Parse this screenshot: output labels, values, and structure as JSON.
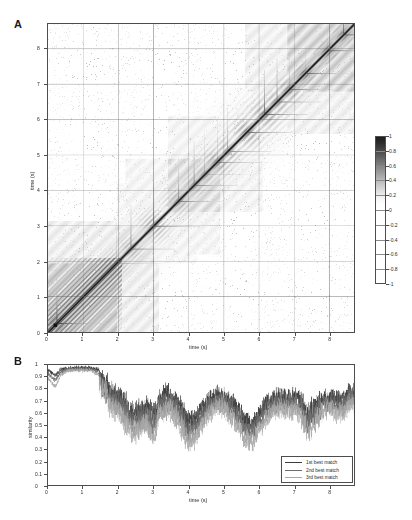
{
  "figure": {
    "panels": [
      {
        "id": "A",
        "label": "A"
      },
      {
        "id": "B",
        "label": "B"
      }
    ]
  },
  "panelA": {
    "label": "A",
    "xlabel": "time (s)",
    "ylabel": "time (s)",
    "xticks": [
      "0",
      "1",
      "2",
      "3",
      "4",
      "5",
      "6",
      "7",
      "8"
    ],
    "yticks": [
      "0",
      "1",
      "2",
      "3",
      "4",
      "5",
      "6",
      "7",
      "8"
    ]
  },
  "colorbar": {
    "ticks": [
      "1",
      "0.8",
      "0.6",
      "0.4",
      "0.2",
      "0",
      "-0.2",
      "-0.4",
      "-0.6",
      "-0.8",
      "-1"
    ],
    "max": "1",
    "min": "-1"
  },
  "panelB": {
    "label": "B",
    "xlabel": "time (s)",
    "ylabel": "similarity",
    "xticks": [
      "0",
      "1",
      "2",
      "3",
      "4",
      "5",
      "6",
      "7",
      "8"
    ],
    "yticks": [
      "0",
      "0.1",
      "0.2",
      "0.3",
      "0.4",
      "0.5",
      "0.6",
      "0.7",
      "0.8",
      "0.9",
      "1"
    ],
    "legend": [
      {
        "label": "1st best match",
        "color": "#3c3c3c"
      },
      {
        "label": "2nd best match",
        "color": "#6e6e6e"
      },
      {
        "label": "3rd best match",
        "color": "#a8a8a8"
      }
    ]
  },
  "chart_data": [
    {
      "type": "heatmap",
      "title": "",
      "panel": "A",
      "xlabel": "time (s)",
      "ylabel": "time (s)",
      "xlim": [
        0,
        8.7
      ],
      "ylim": [
        0,
        8.7
      ],
      "xticks": [
        0,
        1,
        2,
        3,
        4,
        5,
        6,
        7,
        8
      ],
      "yticks": [
        0,
        1,
        2,
        3,
        4,
        5,
        6,
        7,
        8
      ],
      "grid": true,
      "colorbar": {
        "label": "",
        "vmin": -1,
        "vmax": 1,
        "ticks": [
          1,
          0.8,
          0.6,
          0.4,
          0.2,
          0,
          -0.2,
          -0.4,
          -0.6,
          -0.8,
          -1
        ],
        "colormap": "grayscale-inverted"
      },
      "description": "Self-similarity / recurrence matrix of an audio signal; high values on main diagonal with repeating chevron (feather) structures whose period grows with time, plus vertical and horizontal ridge spikes at onsets.",
      "diagonal_events": [
        {
          "t": 0.25,
          "intensity": 1.0
        },
        {
          "t": 1.95,
          "intensity": 0.72
        },
        {
          "t": 2.35,
          "intensity": 0.68
        },
        {
          "t": 3.0,
          "intensity": 0.74
        },
        {
          "t": 3.7,
          "intensity": 0.7
        },
        {
          "t": 4.15,
          "intensity": 0.66
        },
        {
          "t": 4.45,
          "intensity": 0.64
        },
        {
          "t": 4.8,
          "intensity": 0.78
        },
        {
          "t": 5.1,
          "intensity": 0.62
        },
        {
          "t": 5.65,
          "intensity": 0.8
        },
        {
          "t": 6.15,
          "intensity": 0.82
        },
        {
          "t": 6.5,
          "intensity": 0.7
        },
        {
          "t": 6.85,
          "intensity": 0.76
        },
        {
          "t": 7.3,
          "intensity": 0.84
        },
        {
          "t": 7.95,
          "intensity": 0.86
        },
        {
          "t": 8.4,
          "intensity": 0.8
        }
      ],
      "block_regions": [
        {
          "x0": 0.0,
          "x1": 1.95,
          "y0": 0.0,
          "y1": 1.95,
          "mean": 0.45
        },
        {
          "x0": 1.95,
          "x1": 3.0,
          "y0": 1.95,
          "y1": 3.0,
          "mean": 0.22
        },
        {
          "x0": 3.4,
          "x1": 4.9,
          "y0": 3.4,
          "y1": 4.9,
          "mean": 0.3
        },
        {
          "x0": 6.8,
          "x1": 8.7,
          "y0": 6.8,
          "y1": 8.7,
          "mean": 0.38
        }
      ]
    },
    {
      "type": "line",
      "panel": "B",
      "title": "",
      "xlabel": "time (s)",
      "ylabel": "similarity",
      "xlim": [
        0,
        8.7
      ],
      "ylim": [
        0,
        1
      ],
      "xticks": [
        0,
        1,
        2,
        3,
        4,
        5,
        6,
        7,
        8
      ],
      "yticks": [
        0,
        0.1,
        0.2,
        0.3,
        0.4,
        0.5,
        0.6,
        0.7,
        0.8,
        0.9,
        1.0
      ],
      "grid": false,
      "legend_position": "lower right",
      "x": [
        0.0,
        0.2,
        0.4,
        0.6,
        0.8,
        1.0,
        1.2,
        1.4,
        1.6,
        1.8,
        2.0,
        2.2,
        2.4,
        2.6,
        2.8,
        3.0,
        3.2,
        3.4,
        3.6,
        3.8,
        4.0,
        4.2,
        4.4,
        4.6,
        4.8,
        5.0,
        5.2,
        5.4,
        5.6,
        5.8,
        6.0,
        6.2,
        6.4,
        6.6,
        6.8,
        7.0,
        7.2,
        7.4,
        7.6,
        7.8,
        8.0,
        8.2,
        8.4,
        8.6
      ],
      "series": [
        {
          "name": "1st best match",
          "color": "#3c3c3c",
          "values": [
            0.97,
            0.93,
            0.98,
            0.99,
            0.99,
            0.99,
            0.99,
            0.98,
            0.94,
            0.86,
            0.82,
            0.76,
            0.68,
            0.7,
            0.73,
            0.66,
            0.8,
            0.83,
            0.79,
            0.72,
            0.6,
            0.63,
            0.71,
            0.78,
            0.81,
            0.8,
            0.76,
            0.7,
            0.62,
            0.58,
            0.66,
            0.74,
            0.78,
            0.8,
            0.79,
            0.8,
            0.77,
            0.68,
            0.74,
            0.79,
            0.8,
            0.78,
            0.79,
            0.84
          ]
        },
        {
          "name": "2nd best match",
          "color": "#6e6e6e",
          "values": [
            0.94,
            0.89,
            0.96,
            0.98,
            0.98,
            0.98,
            0.98,
            0.96,
            0.9,
            0.8,
            0.76,
            0.68,
            0.6,
            0.63,
            0.66,
            0.58,
            0.74,
            0.78,
            0.73,
            0.64,
            0.52,
            0.56,
            0.65,
            0.72,
            0.77,
            0.76,
            0.7,
            0.63,
            0.54,
            0.5,
            0.59,
            0.68,
            0.73,
            0.75,
            0.74,
            0.75,
            0.72,
            0.61,
            0.68,
            0.74,
            0.75,
            0.72,
            0.74,
            0.8
          ]
        },
        {
          "name": "3rd best match",
          "color": "#a8a8a8",
          "values": [
            0.9,
            0.84,
            0.94,
            0.97,
            0.97,
            0.97,
            0.97,
            0.94,
            0.86,
            0.74,
            0.7,
            0.6,
            0.52,
            0.55,
            0.59,
            0.49,
            0.68,
            0.73,
            0.66,
            0.56,
            0.44,
            0.48,
            0.58,
            0.66,
            0.72,
            0.71,
            0.64,
            0.56,
            0.46,
            0.42,
            0.52,
            0.62,
            0.68,
            0.7,
            0.69,
            0.7,
            0.66,
            0.54,
            0.62,
            0.69,
            0.7,
            0.66,
            0.68,
            0.76
          ]
        }
      ]
    }
  ]
}
